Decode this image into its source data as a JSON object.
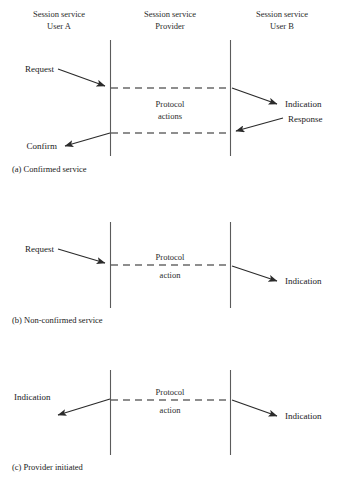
{
  "figure": {
    "columns": [
      {
        "line1": "Session service",
        "line2": "User A"
      },
      {
        "line1": "Session service",
        "line2": "Provider"
      },
      {
        "line1": "Session service",
        "line2": "User B"
      }
    ],
    "panels": [
      {
        "id": "a",
        "caption": "(a) Confirmed service",
        "protocol_label_line1": "Protocol",
        "protocol_label_line2": "actions",
        "labels": {
          "left_top": "Request",
          "left_bottom": "Confirm",
          "right_top": "Indication",
          "right_bottom": "Response"
        }
      },
      {
        "id": "b",
        "caption": "(b) Non-confirmed service",
        "protocol_label_line1": "Protocol",
        "protocol_label_line2": "action",
        "labels": {
          "left_top": "Request",
          "right_top": "Indication"
        }
      },
      {
        "id": "c",
        "caption": "(c) Provider initiated",
        "protocol_label_line1": "Protocol",
        "protocol_label_line2": "action",
        "labels": {
          "left_top": "Indication",
          "right_top": "Indication"
        }
      }
    ],
    "colors": {
      "line": "#5b5b5b",
      "dash": "#6a6a6a",
      "arrow": "#2b2b2b",
      "text": "#1a1a1a",
      "background": "#ffffff"
    }
  }
}
